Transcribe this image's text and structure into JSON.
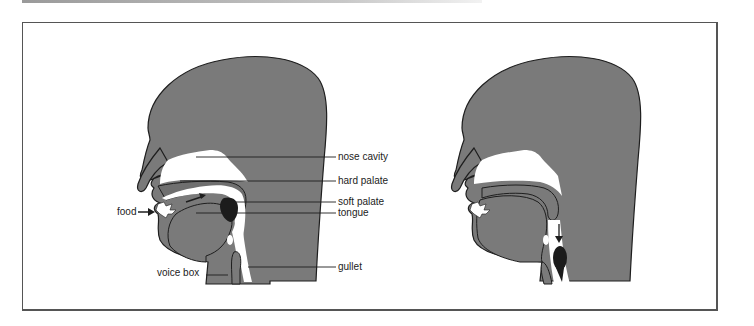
{
  "diagram": {
    "type": "anatomical cross-section",
    "panels": [
      {
        "id": "left",
        "description": "Head cross-section showing food passing over the tongue toward the throat",
        "labels": {
          "nose_cavity": "nose cavity",
          "hard_palate": "hard palate",
          "soft_palate": "soft palate",
          "tongue": "tongue",
          "gullet": "gullet",
          "food": "food",
          "voice_box": "voice box"
        }
      },
      {
        "id": "right",
        "description": "Head cross-section showing food bolus moving down the gullet",
        "labels": {}
      }
    ],
    "colors": {
      "tissue": "#7a7a7a",
      "outline": "#1e1e1e",
      "food_bolus": "#1c1c1c",
      "cavity": "#ffffff"
    }
  }
}
